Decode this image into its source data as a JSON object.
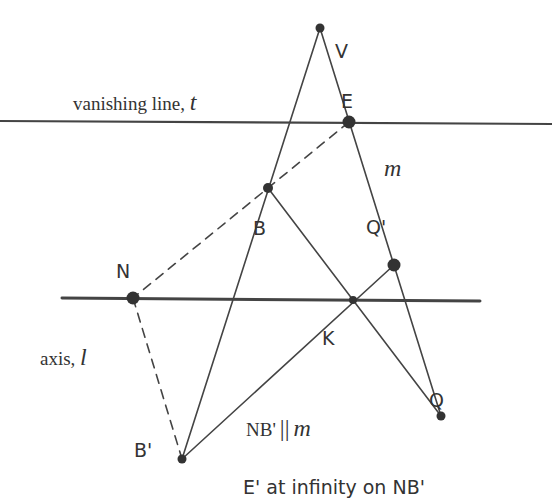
{
  "diagram": {
    "colors": {
      "line": "#444444",
      "point": "#333333",
      "text": "#333333",
      "background": "#ffffff"
    },
    "points": [
      {
        "id": "V",
        "label": "V",
        "x": 320,
        "y": 28
      },
      {
        "id": "E",
        "label": "E",
        "x": 349,
        "y": 122
      },
      {
        "id": "B",
        "label": "B",
        "x": 268,
        "y": 188
      },
      {
        "id": "Qp",
        "label": "Q'",
        "x": 394,
        "y": 265
      },
      {
        "id": "N",
        "label": "N",
        "x": 133,
        "y": 298
      },
      {
        "id": "K",
        "label": "K",
        "x": 353,
        "y": 300
      },
      {
        "id": "Q",
        "label": "Q",
        "x": 441,
        "y": 416
      },
      {
        "id": "Bp",
        "label": "B'",
        "x": 182,
        "y": 459
      }
    ],
    "lines": {
      "vanishing_line": {
        "label_text": "vanishing line, ",
        "label_var": "t"
      },
      "axis": {
        "label_text": "axis, ",
        "label_var": "l"
      },
      "m": {
        "label_var": "m"
      }
    },
    "annotations": {
      "parallel_left": "NB'",
      "parallel_symbol": "||",
      "parallel_right": "m",
      "infinity_note": "E' at infinity on NB'"
    }
  }
}
